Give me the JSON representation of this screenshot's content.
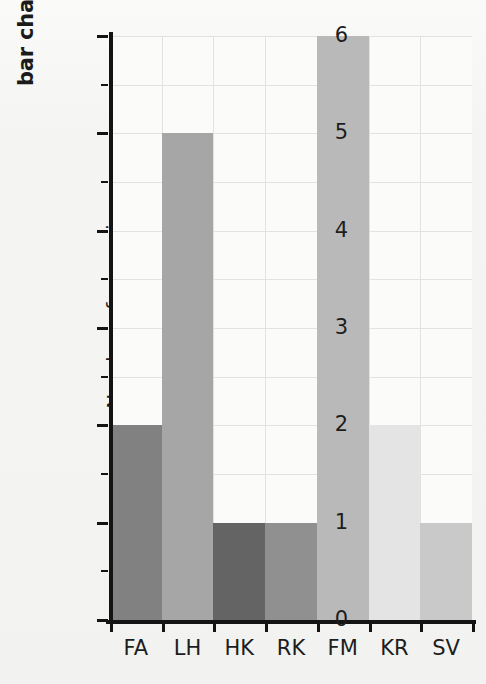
{
  "chart_data": {
    "type": "bar",
    "title": "bar chart",
    "xlabel": "",
    "ylabel": "Number of race wins",
    "categories": [
      "FA",
      "LH",
      "HK",
      "RK",
      "FM",
      "KR",
      "SV"
    ],
    "values": [
      2,
      5,
      1,
      1,
      6,
      2,
      1
    ],
    "bar_colors": [
      "#818181",
      "#a6a6a6",
      "#646464",
      "#909090",
      "#b9b9b9",
      "#e4e4e4",
      "#c9c9c9"
    ],
    "ylim": [
      0,
      6
    ],
    "ytick_labels": [
      "0",
      "1",
      "2",
      "3",
      "4",
      "5",
      "6"
    ],
    "ytick_values": [
      0,
      1,
      2,
      3,
      4,
      5,
      6
    ],
    "yminor_values": [
      0.5,
      1.5,
      2.5,
      3.5,
      4.5,
      5.5
    ],
    "grid": true,
    "legend": "none",
    "plot_background": "#fbfbfa",
    "grid_color": "#e2e2e0",
    "axis_color": "#141414",
    "page_background": "#f4f4f2"
  }
}
